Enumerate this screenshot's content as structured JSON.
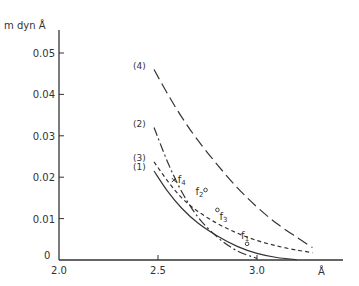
{
  "chart_data": {
    "type": "line",
    "title": "",
    "xlabel": "Å",
    "ylabel": "m dyn Å",
    "xlim": [
      2.0,
      3.3
    ],
    "ylim": [
      0,
      0.055
    ],
    "x_ticks": [
      2.0,
      2.5,
      3.0
    ],
    "x_tick_labels": [
      "2.0",
      "2.5",
      "3.0"
    ],
    "y_ticks": [
      0,
      0.01,
      0.02,
      0.03,
      0.04,
      0.05
    ],
    "y_tick_labels": [
      "0",
      "0.01",
      "0.02",
      "0.03",
      "0.04",
      "0.05"
    ],
    "grid": false,
    "legend": "inline labels at curve starts",
    "series": [
      {
        "name": "(1)",
        "style": "solid",
        "x": [
          2.48,
          2.55,
          2.62,
          2.7,
          2.8,
          2.9,
          3.0,
          3.1,
          3.2
        ],
        "y": [
          0.0215,
          0.0165,
          0.0125,
          0.009,
          0.0058,
          0.0033,
          0.0016,
          0.0006,
          0.0001
        ]
      },
      {
        "name": "(2)",
        "style": "dash-dot",
        "x": [
          2.48,
          2.55,
          2.62,
          2.7,
          2.8,
          2.9,
          3.0
        ],
        "y": [
          0.032,
          0.0235,
          0.0165,
          0.0105,
          0.0055,
          0.0022,
          0.0004
        ]
      },
      {
        "name": "(3)",
        "style": "short-dash",
        "x": [
          2.48,
          2.55,
          2.62,
          2.7,
          2.8,
          2.9,
          3.0,
          3.1,
          3.2,
          3.28
        ],
        "y": [
          0.0237,
          0.019,
          0.015,
          0.0118,
          0.0088,
          0.0065,
          0.0047,
          0.0034,
          0.0024,
          0.0018
        ]
      },
      {
        "name": "(4)",
        "style": "long-dash",
        "x": [
          2.48,
          2.55,
          2.62,
          2.7,
          2.8,
          2.9,
          3.0,
          3.1,
          3.2,
          3.28
        ],
        "y": [
          0.046,
          0.04,
          0.0345,
          0.029,
          0.023,
          0.0175,
          0.0128,
          0.0088,
          0.0055,
          0.003
        ]
      }
    ],
    "points": [
      {
        "name": "f1",
        "marker": "circle",
        "x": 2.95,
        "y": 0.0039
      },
      {
        "name": "f2",
        "marker": "circle",
        "x": 2.74,
        "y": 0.0169
      },
      {
        "name": "f3",
        "marker": "circle",
        "x": 2.8,
        "y": 0.0121
      },
      {
        "name": "f4",
        "marker": "cross",
        "x": 2.58,
        "y": 0.0193
      }
    ],
    "colors": {
      "ink": "#333333",
      "background": "#ffffff"
    }
  }
}
